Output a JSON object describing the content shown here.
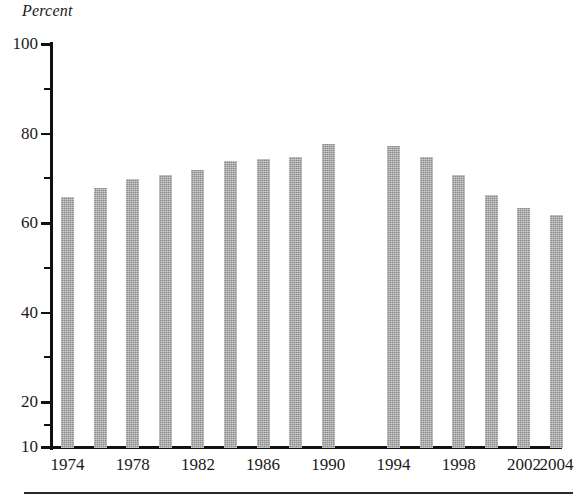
{
  "chart_data": {
    "type": "bar",
    "title": "",
    "ylabel": "Percent",
    "xlabel": "",
    "ylim": [
      10,
      100
    ],
    "grid": false,
    "legend": null,
    "y_tick_labels": [
      "100",
      "80",
      "60",
      "40",
      "20",
      "10"
    ],
    "y_ticks_major": [
      100,
      80,
      60,
      40,
      20,
      10
    ],
    "y_ticks_minor": [
      90,
      70,
      50,
      30,
      15
    ],
    "x_tick_labels": [
      "1974",
      "1978",
      "1982",
      "1986",
      "1990",
      "1994",
      "1998",
      "2002",
      "2004"
    ],
    "categories": [
      "1974",
      "1976",
      "1978",
      "1980",
      "1982",
      "1984",
      "1986",
      "1988",
      "1990",
      "1994",
      "1996",
      "1998",
      "2000",
      "2002",
      "2004"
    ],
    "values": [
      66,
      68,
      70,
      71,
      72,
      74,
      74.5,
      75,
      78,
      77.5,
      75,
      71,
      66.5,
      63.5,
      62
    ],
    "bars": [
      {
        "label": "1974",
        "value": 66
      },
      {
        "label": "1976",
        "value": 68
      },
      {
        "label": "1978",
        "value": 70
      },
      {
        "label": "1980",
        "value": 71
      },
      {
        "label": "1982",
        "value": 72
      },
      {
        "label": "1984",
        "value": 74
      },
      {
        "label": "1986",
        "value": 74.5
      },
      {
        "label": "1988",
        "value": 75
      },
      {
        "label": "1990",
        "value": 78
      },
      {
        "label": "1994",
        "value": 77.5
      },
      {
        "label": "1996",
        "value": 75
      },
      {
        "label": "1998",
        "value": 71
      },
      {
        "label": "2000",
        "value": 66.5
      },
      {
        "label": "2002",
        "value": 63.5
      },
      {
        "label": "2004",
        "value": 62
      }
    ],
    "missing_category": "1992",
    "bar_color": "#9d9d9d",
    "axis_color": "#111111"
  },
  "axis": {
    "y_title": "Percent"
  }
}
